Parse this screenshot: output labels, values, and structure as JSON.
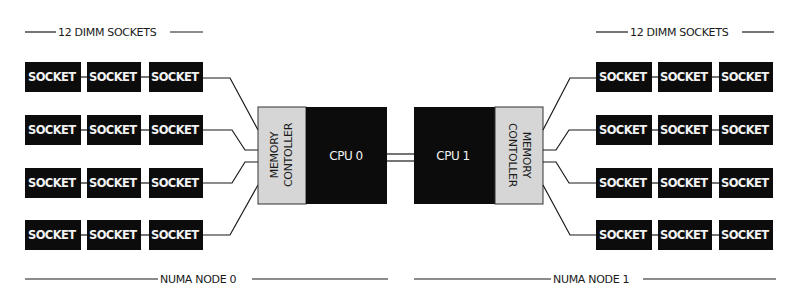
{
  "diagram": {
    "left_header": "12 DIMM SOCKETS",
    "right_header": "12 DIMM SOCKETS",
    "socket_label": "SOCKET",
    "node0": {
      "label": "NUMA NODE 0",
      "cpu": "CPU 0",
      "mc_line1": "MEMORY",
      "mc_line2": "CONTOLLER",
      "rows": [
        [
          "SOCKET",
          "SOCKET",
          "SOCKET"
        ],
        [
          "SOCKET",
          "SOCKET",
          "SOCKET"
        ],
        [
          "SOCKET",
          "SOCKET",
          "SOCKET"
        ],
        [
          "SOCKET",
          "SOCKET",
          "SOCKET"
        ]
      ]
    },
    "node1": {
      "label": "NUMA NODE 1",
      "cpu": "CPU 1",
      "mc_line1": "MEMORY",
      "mc_line2": "CONTOLLER",
      "rows": [
        [
          "SOCKET",
          "SOCKET",
          "SOCKET"
        ],
        [
          "SOCKET",
          "SOCKET",
          "SOCKET"
        ],
        [
          "SOCKET",
          "SOCKET",
          "SOCKET"
        ],
        [
          "SOCKET",
          "SOCKET",
          "SOCKET"
        ]
      ]
    },
    "colors": {
      "block": "#0c0c0c",
      "controller": "#d6d6d6",
      "line": "#1a1a1a",
      "background": "#ffffff"
    }
  }
}
